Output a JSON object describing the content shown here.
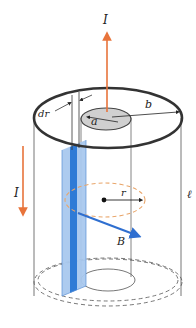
{
  "figure": {
    "labels": {
      "current_top": "I",
      "current_left": "I",
      "inner_radius": "a",
      "outer_radius": "b",
      "shell_thickness": "dr",
      "radius": "r",
      "field": "B",
      "length": "ℓ"
    },
    "colors": {
      "current_arrow": "#e8743b",
      "shell_light": "#a9c8ee",
      "shell_dark": "#2f7bd6",
      "field_arrow": "#2f6fd0",
      "amperian_loop": "#e9a66b",
      "outer_rim": "#333333",
      "inner_disk": "#d0d0d0",
      "outline": "#555555"
    }
  }
}
